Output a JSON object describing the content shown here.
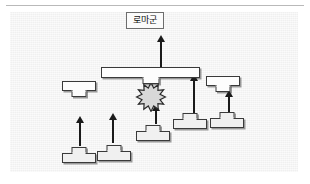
{
  "figure": {
    "title_label": "로마군",
    "panel": {
      "band_colors": [
        "#858585",
        "#8e8e8e",
        "#9b9b9b",
        "#a8a8a8",
        "#b5b5b5",
        "#c3c3c3",
        "#d2d2d2",
        "#e0e0e0",
        "#ebebeb",
        "#f4f4f4",
        "#fbfbfb"
      ],
      "unit_fill_front": "#fdfdfd",
      "unit_fill_rear": "#f0f0f0",
      "unit_stroke": "#3a3a3a",
      "arrow_color": "#1a1a1a",
      "burst_fill": "#d6d6d6",
      "burst_stroke": "#2b2b2b"
    },
    "units": [
      {
        "id": "roman-main-line",
        "shape": "t-down",
        "label": ""
      },
      {
        "id": "roman-left-flank",
        "shape": "t-down",
        "label": ""
      },
      {
        "id": "roman-right-flank",
        "shape": "t-down",
        "label": ""
      },
      {
        "id": "enemy-center-1",
        "shape": "t-up",
        "label": ""
      },
      {
        "id": "enemy-center-2",
        "shape": "t-up",
        "label": ""
      },
      {
        "id": "enemy-center-3",
        "shape": "t-up",
        "label": ""
      },
      {
        "id": "enemy-rear-left-1",
        "shape": "t-up",
        "label": ""
      },
      {
        "id": "enemy-rear-left-2",
        "shape": "t-up",
        "label": ""
      },
      {
        "id": "enemy-right-flank",
        "shape": "t-up",
        "label": ""
      }
    ],
    "arrows": [
      {
        "id": "advance-arrow-top"
      },
      {
        "id": "advance-arrow-center"
      },
      {
        "id": "advance-arrow-right-inner"
      },
      {
        "id": "advance-arrow-right-outer"
      },
      {
        "id": "advance-arrow-left-outer"
      },
      {
        "id": "advance-arrow-left-inner"
      }
    ],
    "clash": {
      "id": "battle-clash-burst",
      "points": 12
    }
  }
}
